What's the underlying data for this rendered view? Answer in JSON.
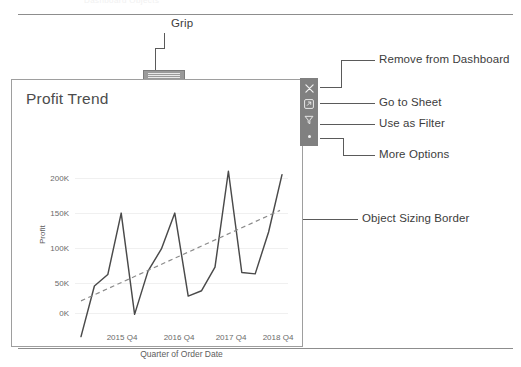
{
  "page": {
    "ghost_text_top": "Dashboard Objects",
    "background": "#ffffff",
    "rule_color": "#8d8d8d"
  },
  "annotations": [
    {
      "id": "grip",
      "label": "Grip"
    },
    {
      "id": "remove-from-dashboard",
      "label": "Remove from Dashboard"
    },
    {
      "id": "go-to-sheet",
      "label": "Go to Sheet"
    },
    {
      "id": "use-as-filter",
      "label": "Use as Filter"
    },
    {
      "id": "more-options",
      "label": "More Options"
    },
    {
      "id": "object-sizing-border",
      "label": "Object Sizing Border"
    }
  ],
  "dashboard_object": {
    "title": "Profit Trend",
    "border_color": "#9e9e9e",
    "grip": {
      "name": "grip-handle",
      "color": "#9a9a9a"
    },
    "toolbar": {
      "background": "#808080",
      "buttons": [
        {
          "icon": "close-icon",
          "tooltip": "Remove from Dashboard"
        },
        {
          "icon": "external-link-icon",
          "tooltip": "Go to Sheet"
        },
        {
          "icon": "funnel-icon",
          "tooltip": "Use as Filter"
        },
        {
          "icon": "more-options-icon",
          "tooltip": "More Options"
        }
      ]
    }
  },
  "chart_data": {
    "type": "line",
    "title": "Profit Trend",
    "xlabel": "Quarter of Order Date",
    "ylabel": "Profit",
    "ylim": [
      -40000,
      230000
    ],
    "yticks": [
      0,
      50000,
      100000,
      150000,
      200000
    ],
    "ytick_labels": [
      "0K",
      "50K",
      "100K",
      "150K",
      "200K"
    ],
    "xtick_labels": [
      "2015 Q4",
      "2016 Q4",
      "2017 Q4",
      "2018 Q4"
    ],
    "grid": true,
    "legend": "none",
    "series": [
      {
        "name": "Profit",
        "style": "solid",
        "color": "#4a4a4a",
        "x": [
          "2015 Q1",
          "2015 Q2",
          "2015 Q3",
          "2015 Q4",
          "2016 Q1",
          "2016 Q2",
          "2016 Q3",
          "2016 Q4",
          "2017 Q1",
          "2017 Q2",
          "2017 Q3",
          "2017 Q4",
          "2018 Q1",
          "2018 Q2",
          "2018 Q3",
          "2018 Q4"
        ],
        "values": [
          -35000,
          40000,
          57000,
          148000,
          -2000,
          62000,
          95000,
          148000,
          25000,
          33000,
          68000,
          210000,
          60000,
          58000,
          120000,
          205000
        ]
      },
      {
        "name": "Trend Line",
        "style": "dashed",
        "color": "#8b8b8b",
        "x": [
          "2015 Q1",
          "2018 Q4"
        ],
        "values": [
          18000,
          152000
        ]
      }
    ]
  }
}
